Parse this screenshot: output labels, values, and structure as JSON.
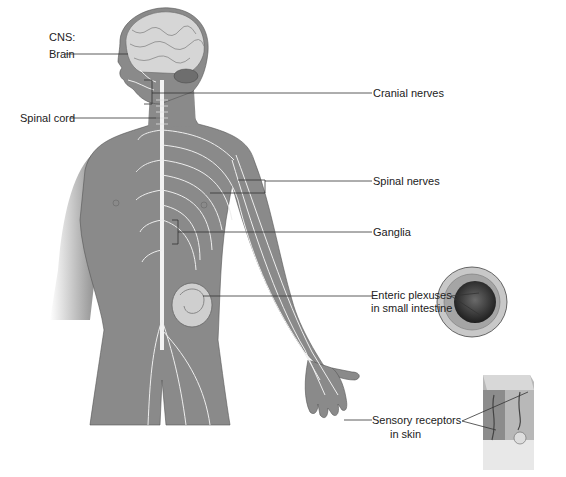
{
  "labels": {
    "cns": "CNS:",
    "brain": "Brain",
    "spinal_cord": "Spinal cord",
    "cranial_nerves": "Cranial nerves",
    "spinal_nerves": "Spinal nerves",
    "ganglia": "Ganglia",
    "enteric_line1": "Enteric plexuses",
    "enteric_line2": "in small intestine",
    "sensory_line1": "Sensory receptors",
    "sensory_line2": "in skin"
  },
  "colors": {
    "body": "#8a8a8a",
    "nerve": "#f2f2f2",
    "brain": "#d6d6d6",
    "leader": "#333333"
  }
}
